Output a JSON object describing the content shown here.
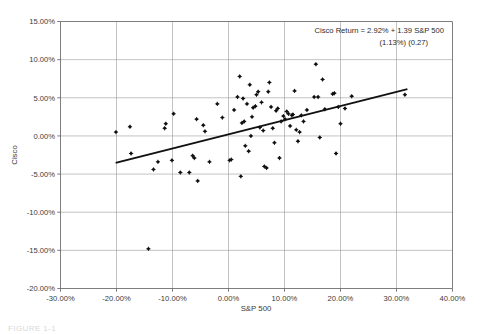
{
  "figure": {
    "caption": "FIGURE 1-1"
  },
  "chart_data": {
    "type": "scatter",
    "title": "",
    "xlabel": "S&P 500",
    "ylabel": "Cisco",
    "xlim": [
      -30,
      40
    ],
    "ylim": [
      -20,
      15
    ],
    "grid": true,
    "legend_position": "none",
    "xticks": [
      -30,
      -20,
      -10,
      0,
      10,
      20,
      30,
      40
    ],
    "yticks": [
      -20,
      -15,
      -10,
      -5,
      0,
      5,
      10,
      15
    ],
    "xticklabels": [
      "-30.00%",
      "-20.00%",
      "-10.00%",
      "0.00%",
      "10.00%",
      "20.00%",
      "30.00%",
      "40.00%"
    ],
    "yticklabels": [
      "-20.00%",
      "-15.00%",
      "-10.00%",
      "-5.00%",
      "0.00%",
      "5.00%",
      "10.00%",
      "15.00%"
    ],
    "annotations": [
      "Cisco Return = 2.92% + 1.39 S&P 500",
      "(1.13%)  (0.27)"
    ],
    "regression": {
      "intercept": 2.92,
      "slope": 1.39,
      "intercept_stderr": "1.13%",
      "slope_stderr": "0.27",
      "x_start": -20.0,
      "y_start": -3.5,
      "x_end": 31.8,
      "y_end": 6.1
    },
    "series": [
      {
        "name": "Cisco vs S&P 500 monthly returns",
        "points": [
          [
            -20.1,
            0.5
          ],
          [
            -17.6,
            1.2
          ],
          [
            -17.4,
            -2.3
          ],
          [
            -14.3,
            -14.8
          ],
          [
            -13.4,
            -4.4
          ],
          [
            -12.6,
            -3.4
          ],
          [
            -11.4,
            1.0
          ],
          [
            -11.2,
            1.6
          ],
          [
            -10.1,
            -3.2
          ],
          [
            -9.8,
            2.9
          ],
          [
            -8.6,
            -4.8
          ],
          [
            -7.0,
            -4.8
          ],
          [
            -6.4,
            -2.6
          ],
          [
            -6.1,
            -2.9
          ],
          [
            -5.7,
            2.2
          ],
          [
            -5.5,
            -5.9
          ],
          [
            -4.5,
            1.4
          ],
          [
            -4.2,
            0.6
          ],
          [
            -3.4,
            -3.4
          ],
          [
            -2.0,
            4.2
          ],
          [
            -1.1,
            2.4
          ],
          [
            0.2,
            -3.2
          ],
          [
            0.5,
            -3.1
          ],
          [
            1.0,
            3.4
          ],
          [
            1.6,
            5.1
          ],
          [
            2.0,
            7.8
          ],
          [
            2.2,
            -5.3
          ],
          [
            2.4,
            1.7
          ],
          [
            2.6,
            4.9
          ],
          [
            2.8,
            1.9
          ],
          [
            3.0,
            -1.3
          ],
          [
            3.3,
            4.2
          ],
          [
            3.6,
            -2.0
          ],
          [
            3.8,
            6.7
          ],
          [
            4.0,
            0.0
          ],
          [
            4.2,
            2.5
          ],
          [
            4.4,
            3.7
          ],
          [
            4.8,
            3.9
          ],
          [
            5.0,
            5.4
          ],
          [
            5.3,
            5.8
          ],
          [
            5.6,
            1.1
          ],
          [
            5.9,
            4.4
          ],
          [
            6.2,
            0.7
          ],
          [
            6.4,
            -4.0
          ],
          [
            6.8,
            -4.2
          ],
          [
            7.1,
            5.8
          ],
          [
            7.3,
            7.0
          ],
          [
            7.6,
            3.8
          ],
          [
            7.9,
            1.0
          ],
          [
            8.2,
            -0.9
          ],
          [
            8.5,
            3.3
          ],
          [
            8.8,
            3.6
          ],
          [
            9.1,
            -2.9
          ],
          [
            9.4,
            1.9
          ],
          [
            9.8,
            2.6
          ],
          [
            10.1,
            2.2
          ],
          [
            10.4,
            3.2
          ],
          [
            10.7,
            2.9
          ],
          [
            11.0,
            1.3
          ],
          [
            11.3,
            2.7
          ],
          [
            11.5,
            2.8
          ],
          [
            11.8,
            5.9
          ],
          [
            12.1,
            0.8
          ],
          [
            12.4,
            -0.7
          ],
          [
            12.7,
            0.5
          ],
          [
            13.0,
            2.7
          ],
          [
            13.4,
            1.9
          ],
          [
            14.0,
            3.4
          ],
          [
            15.3,
            5.1
          ],
          [
            15.6,
            9.4
          ],
          [
            16.0,
            5.1
          ],
          [
            16.3,
            -0.2
          ],
          [
            16.8,
            7.4
          ],
          [
            17.2,
            3.5
          ],
          [
            18.6,
            5.5
          ],
          [
            18.9,
            5.6
          ],
          [
            19.2,
            -2.3
          ],
          [
            19.6,
            3.8
          ],
          [
            20.0,
            1.6
          ],
          [
            20.8,
            3.6
          ],
          [
            22.0,
            5.2
          ],
          [
            31.5,
            5.4
          ]
        ]
      }
    ]
  }
}
